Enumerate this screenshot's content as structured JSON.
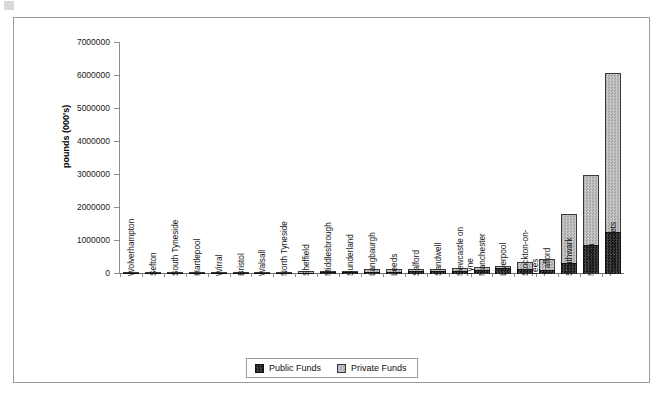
{
  "chart_data": {
    "type": "bar",
    "stacked": true,
    "title": "",
    "xlabel": "",
    "ylabel": "pounds (000's)",
    "ylim": [
      0,
      7000000
    ],
    "ytick_values": [
      0,
      1000000,
      2000000,
      3000000,
      4000000,
      5000000,
      6000000,
      7000000
    ],
    "ytick_labels": [
      "0",
      "1000000",
      "2000000",
      "3000000",
      "4000000",
      "5000000",
      "6000000",
      "7000000"
    ],
    "grid": false,
    "legend_position": "bottom-center",
    "categories": [
      "Wolverhampton",
      "Sefton",
      "South Tyneside",
      "Hartlepool",
      "Wirral",
      "Bristol",
      "Walsall",
      "North Tyneside",
      "Sheffield",
      "Middlesbrough",
      "Sunderland",
      "Langbaurgh",
      "Leeds",
      "Salford",
      "Sandwell",
      "Newcastle on Tyne",
      "Manchester",
      "Liverpool",
      "Stockton-on-Tees",
      "Trafford",
      "Southwark",
      "Newham",
      "Tower Hamlets"
    ],
    "category_label_lines": [
      [
        "Wolverhampton"
      ],
      [
        "Sefton"
      ],
      [
        "South Tyneside"
      ],
      [
        "Hartlepool"
      ],
      [
        "Wirral"
      ],
      [
        "Bristol"
      ],
      [
        "Walsall"
      ],
      [
        "North Tyneside"
      ],
      [
        "Sheffield"
      ],
      [
        "Middlesbrough"
      ],
      [
        "Sunderland"
      ],
      [
        "Langbaurgh"
      ],
      [
        "Leeds"
      ],
      [
        "Salford"
      ],
      [
        "Sandwell"
      ],
      [
        "Newcastle on",
        "Tyne"
      ],
      [
        "Manchester"
      ],
      [
        "Liverpool"
      ],
      [
        "Stockton-on-",
        "Tees"
      ],
      [
        "Trafford"
      ],
      [
        "Southwark"
      ],
      [
        "Newham"
      ],
      [
        "Tower Hamlets"
      ]
    ],
    "series": [
      {
        "name": "Public Funds",
        "color": "#2b2b2b",
        "values": [
          15000,
          18000,
          22000,
          26000,
          30000,
          32000,
          36000,
          40000,
          45000,
          48000,
          55000,
          60000,
          70000,
          80000,
          90000,
          100000,
          120000,
          180000,
          140000,
          110000,
          330000,
          880000,
          1270000
        ]
      },
      {
        "name": "Private Funds",
        "color": "#b4b4b4",
        "values": [
          5000,
          8000,
          12000,
          16000,
          18000,
          22000,
          24000,
          30000,
          35000,
          42000,
          50000,
          80000,
          70000,
          80000,
          75000,
          90000,
          80000,
          60000,
          210000,
          340000,
          1480000,
          2120000,
          4830000
        ]
      }
    ],
    "totals": [
      20000,
      26000,
      34000,
      42000,
      48000,
      54000,
      60000,
      70000,
      80000,
      90000,
      105000,
      140000,
      140000,
      160000,
      165000,
      190000,
      200000,
      240000,
      350000,
      450000,
      1810000,
      3000000,
      6100000
    ]
  },
  "legend": {
    "entries": [
      {
        "label": "Public Funds"
      },
      {
        "label": "Private Funds"
      }
    ]
  }
}
